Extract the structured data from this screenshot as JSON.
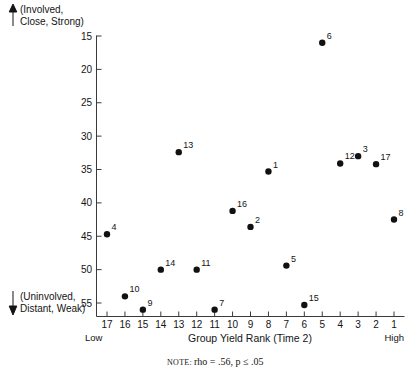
{
  "chart_data": {
    "type": "scatter",
    "title": "",
    "xlabel": "Group Yield Rank (Time 2)",
    "ylabel": "",
    "xlim": [
      17.6,
      0.6
    ],
    "ylim": [
      56.5,
      13.5
    ],
    "x_ticks": [
      17,
      16,
      15,
      14,
      13,
      12,
      11,
      10,
      9,
      8,
      7,
      6,
      5,
      4,
      3,
      2,
      1
    ],
    "y_ticks": [
      15,
      20,
      25,
      30,
      35,
      40,
      45,
      50,
      55
    ],
    "x_axis_low_label": "Low",
    "x_axis_high_label": "High",
    "y_axis_top_label": "(Involved,\nClose, Strong)",
    "y_axis_top_label_line1": "(Involved,",
    "y_axis_top_label_line2": "Close, Strong)",
    "y_axis_bottom_label_line1": "(Uninvolved,",
    "y_axis_bottom_label_line2": "Distant, Weak)",
    "grid": false,
    "legend": false,
    "note": "rho = .56, p ≤ .05",
    "note_prefix": "NOTE:",
    "point_labels_shown": true,
    "points": [
      {
        "label": "6",
        "x": 5,
        "y": 16.0
      },
      {
        "label": "13",
        "x": 13,
        "y": 32.4
      },
      {
        "label": "3",
        "x": 3,
        "y": 33.0
      },
      {
        "label": "12",
        "x": 4,
        "y": 34.1
      },
      {
        "label": "17",
        "x": 2,
        "y": 34.2
      },
      {
        "label": "1",
        "x": 8,
        "y": 35.3
      },
      {
        "label": "16",
        "x": 10,
        "y": 41.2
      },
      {
        "label": "8",
        "x": 1,
        "y": 42.5
      },
      {
        "label": "2",
        "x": 9,
        "y": 43.6
      },
      {
        "label": "4",
        "x": 17,
        "y": 44.7
      },
      {
        "label": "5",
        "x": 7,
        "y": 49.4
      },
      {
        "label": "14",
        "x": 14,
        "y": 50.0
      },
      {
        "label": "11",
        "x": 12,
        "y": 50.0
      },
      {
        "label": "10",
        "x": 16,
        "y": 54.0
      },
      {
        "label": "15",
        "x": 6,
        "y": 55.3
      },
      {
        "label": "9",
        "x": 15,
        "y": 56.0
      },
      {
        "label": "7",
        "x": 11,
        "y": 56.0
      }
    ]
  },
  "colors": {
    "point": "#111111",
    "axis": "#3a3a3a",
    "text": "#141414",
    "background": "#ffffff"
  }
}
